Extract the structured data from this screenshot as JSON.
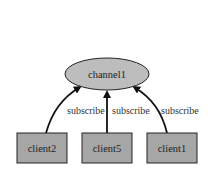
{
  "diagram": {
    "channel": {
      "label": "channel1",
      "fill": "#bdbdbd",
      "stroke": "#222222"
    },
    "clients": [
      {
        "label": "client2",
        "edge_label": "subscribe"
      },
      {
        "label": "client5",
        "edge_label": "subscribe"
      },
      {
        "label": "client1",
        "edge_label": "subscribe"
      }
    ],
    "client_fill": "#a6a6a6",
    "edge_color": "#111111"
  }
}
